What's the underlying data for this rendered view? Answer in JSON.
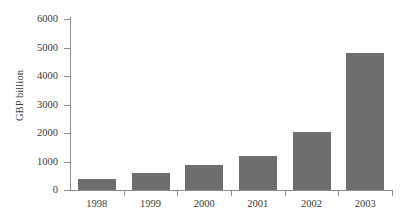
{
  "chart_data": {
    "type": "bar",
    "title": "",
    "xlabel": "",
    "ylabel": "GBP billion",
    "categories": [
      "1998",
      "1999",
      "2000",
      "2001",
      "2002",
      "2003"
    ],
    "values": [
      400,
      580,
      880,
      1190,
      2050,
      4800
    ],
    "ylim": [
      0,
      6000
    ],
    "yticks": [
      0,
      1000,
      2000,
      3000,
      4000,
      5000,
      6000
    ],
    "ytick_labels": [
      "0",
      "1000",
      "2000",
      "3000",
      "4000",
      "5000",
      "6000"
    ],
    "grid": false,
    "legend": false,
    "bar_color": "#6e6e6e",
    "axis_color": "#8d8d8d",
    "background": "#ffffff",
    "series": [
      {
        "name": "GBP billion",
        "values": [
          400,
          580,
          880,
          1190,
          2050,
          4800
        ]
      }
    ]
  }
}
